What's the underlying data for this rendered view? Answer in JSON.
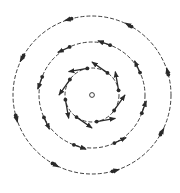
{
  "diagram": {
    "type": "vortex-velocity-field",
    "center": {
      "x": 92,
      "y": 95,
      "marker_radius": 2.4
    },
    "colors": {
      "stroke": "#2a2a2a",
      "background": "#ffffff"
    },
    "rotation": "counter-clockwise",
    "rings": [
      {
        "name": "inner",
        "radius": 27,
        "arrow_count": 8,
        "arrow_length": 19,
        "angle_offset_deg": 10
      },
      {
        "name": "middle",
        "radius": 53,
        "arrow_count": 8,
        "arrow_length": 13,
        "angle_offset_deg": 25
      },
      {
        "name": "outer",
        "radius": 79,
        "arrow_count": 8,
        "arrow_length": 7,
        "angle_offset_deg": 15
      }
    ]
  }
}
